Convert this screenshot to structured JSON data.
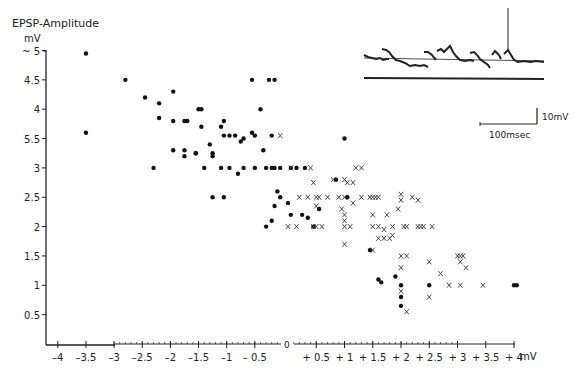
{
  "chart_data": {
    "type": "scatter",
    "title": "",
    "ylabel": "EPSP-Amplitude",
    "yunit": "mV",
    "xunit": "mV",
    "xlabel": "mV",
    "ylim": [
      0,
      5
    ],
    "xlim": [
      -4,
      4
    ],
    "grid": false,
    "y_ticks": [
      {
        "v": 5,
        "label": "~ 5"
      },
      {
        "v": 4.5,
        "label": "4.5"
      },
      {
        "v": 4,
        "label": "4"
      },
      {
        "v": 3.5,
        "label": "5.5"
      },
      {
        "v": 3,
        "label": "3"
      },
      {
        "v": 2.5,
        "label": "2.5"
      },
      {
        "v": 2,
        "label": "2"
      },
      {
        "v": 1.5,
        "label": "1.5"
      },
      {
        "v": 1,
        "label": "1"
      },
      {
        "v": 0.5,
        "label": "0.5"
      }
    ],
    "x_ticks_neg": [
      {
        "v": -4,
        "label": "-4"
      },
      {
        "v": -3.5,
        "label": "-3.5"
      },
      {
        "v": -3,
        "label": "-3"
      },
      {
        "v": -2.5,
        "label": "-2.5"
      },
      {
        "v": -2,
        "label": "-2"
      },
      {
        "v": -1.5,
        "label": "-1.5"
      },
      {
        "v": -1,
        "label": "-1"
      },
      {
        "v": -0.5,
        "label": "- 0.5"
      }
    ],
    "x_ticks_pos": [
      {
        "v": 0.5,
        "label": "+ 0.5"
      },
      {
        "v": 1,
        "label": "+ 1"
      },
      {
        "v": 1.5,
        "label": "+ 1.5"
      },
      {
        "v": 2,
        "label": "+ 2"
      },
      {
        "v": 2.5,
        "label": "+ 2.5"
      },
      {
        "v": 3,
        "label": "+ 3"
      },
      {
        "v": 3.5,
        "label": "+ 3.5"
      },
      {
        "v": 4,
        "label": "+ 4"
      }
    ],
    "zero_label": "0",
    "series": [
      {
        "name": "dots",
        "marker": "filled-circle",
        "points": [
          [
            -3.5,
            4.95
          ],
          [
            -3.5,
            3.6
          ],
          [
            -2.8,
            4.5
          ],
          [
            -2.45,
            4.2
          ],
          [
            -2.2,
            4.1
          ],
          [
            -1.95,
            4.3
          ],
          [
            -2.2,
            3.85
          ],
          [
            -1.95,
            3.8
          ],
          [
            -1.75,
            3.8
          ],
          [
            -1.7,
            3.8
          ],
          [
            -2.3,
            3.0
          ],
          [
            -1.95,
            3.3
          ],
          [
            -1.75,
            3.3
          ],
          [
            -1.75,
            3.2
          ],
          [
            -1.5,
            4.0
          ],
          [
            -1.45,
            4.0
          ],
          [
            -1.45,
            3.7
          ],
          [
            -1.3,
            3.4
          ],
          [
            -1.55,
            3.25
          ],
          [
            -1.55,
            3.25
          ],
          [
            -1.4,
            3.0
          ],
          [
            -1.25,
            3.25
          ],
          [
            -1.25,
            3.2
          ],
          [
            -1.1,
            3.7
          ],
          [
            -1.05,
            3.8
          ],
          [
            -1.05,
            3.55
          ],
          [
            -0.95,
            3.55
          ],
          [
            -0.85,
            3.55
          ],
          [
            -0.75,
            3.45
          ],
          [
            -0.7,
            3.5
          ],
          [
            -1.25,
            2.5
          ],
          [
            -1.05,
            2.5
          ],
          [
            -1.1,
            3.0
          ],
          [
            -0.95,
            3.0
          ],
          [
            -0.8,
            2.9
          ],
          [
            -0.7,
            3.0
          ],
          [
            -0.55,
            4.5
          ],
          [
            -0.4,
            4.0
          ],
          [
            -0.5,
            3.55
          ],
          [
            -0.55,
            3.6
          ],
          [
            -0.35,
            3.3
          ],
          [
            -0.3,
            3.0
          ],
          [
            -0.5,
            3.0
          ],
          [
            -0.2,
            3.0
          ],
          [
            -0.25,
            4.5
          ],
          [
            -0.15,
            4.5
          ],
          [
            -0.2,
            3.55
          ],
          [
            -0.15,
            3.0
          ],
          [
            -0.05,
            3.0
          ],
          [
            0.05,
            3.0
          ],
          [
            0.15,
            3.0
          ],
          [
            0.3,
            3.0
          ],
          [
            -0.3,
            2.0
          ],
          [
            -0.2,
            2.1
          ],
          [
            -0.1,
            2.6
          ],
          [
            -0.15,
            2.35
          ],
          [
            0.0,
            2.4
          ],
          [
            0.05,
            2.2
          ],
          [
            -0.05,
            2.5
          ],
          [
            0.45,
            2.0
          ],
          [
            0.55,
            2.3
          ],
          [
            0.85,
            2.8
          ],
          [
            1.0,
            3.5
          ],
          [
            1.05,
            2.5
          ],
          [
            1.45,
            1.6
          ],
          [
            1.6,
            1.1
          ],
          [
            1.65,
            1.05
          ],
          [
            1.9,
            1.15
          ],
          [
            2.0,
            1.0
          ],
          [
            2.0,
            0.8
          ],
          [
            2.0,
            0.65
          ],
          [
            2.5,
            1.0
          ],
          [
            4.0,
            1.0
          ],
          [
            4.05,
            1.0
          ],
          [
            0.25,
            2.2
          ],
          [
            0.35,
            2.15
          ]
        ]
      },
      {
        "name": "crosses",
        "marker": "x",
        "points": [
          [
            -0.05,
            3.55
          ],
          [
            0.05,
            3.0
          ],
          [
            0.2,
            2.5
          ],
          [
            0.35,
            2.5
          ],
          [
            0.5,
            2.5
          ],
          [
            0.5,
            2.35
          ],
          [
            0.55,
            2.5
          ],
          [
            0.4,
            3.0
          ],
          [
            0.45,
            2.75
          ],
          [
            0.7,
            2.5
          ],
          [
            0.9,
            2.5
          ],
          [
            0.8,
            2.8
          ],
          [
            1.0,
            2.8
          ],
          [
            1.05,
            2.75
          ],
          [
            1.15,
            2.75
          ],
          [
            1.0,
            2.5
          ],
          [
            1.0,
            2.2
          ],
          [
            1.0,
            2.1
          ],
          [
            1.15,
            2.4
          ],
          [
            1.2,
            3.0
          ],
          [
            1.3,
            3.0
          ],
          [
            1.3,
            2.5
          ],
          [
            1.45,
            2.5
          ],
          [
            1.5,
            2.5
          ],
          [
            1.55,
            2.5
          ],
          [
            1.6,
            2.5
          ],
          [
            1.5,
            2.2
          ],
          [
            1.75,
            2.2
          ],
          [
            1.95,
            2.3
          ],
          [
            2.0,
            2.55
          ],
          [
            2.0,
            2.45
          ],
          [
            2.2,
            2.5
          ],
          [
            2.3,
            2.45
          ],
          [
            0.0,
            2.0
          ],
          [
            0.15,
            2.0
          ],
          [
            0.45,
            2.0
          ],
          [
            0.5,
            2.0
          ],
          [
            0.6,
            2.0
          ],
          [
            1.0,
            2.0
          ],
          [
            1.1,
            2.0
          ],
          [
            1.5,
            2.0
          ],
          [
            1.6,
            2.0
          ],
          [
            1.85,
            2.0
          ],
          [
            2.05,
            2.0
          ],
          [
            2.1,
            2.0
          ],
          [
            2.3,
            2.0
          ],
          [
            2.35,
            2.0
          ],
          [
            2.4,
            2.0
          ],
          [
            2.55,
            2.0
          ],
          [
            1.7,
            1.95
          ],
          [
            1.6,
            1.8
          ],
          [
            1.7,
            1.8
          ],
          [
            1.8,
            1.8
          ],
          [
            1.85,
            1.85
          ],
          [
            1.0,
            1.7
          ],
          [
            1.5,
            1.6
          ],
          [
            2.0,
            1.5
          ],
          [
            2.1,
            1.5
          ],
          [
            2.0,
            1.3
          ],
          [
            2.5,
            1.4
          ],
          [
            2.7,
            1.2
          ],
          [
            2.85,
            1.0
          ],
          [
            3.0,
            1.5
          ],
          [
            3.05,
            1.5
          ],
          [
            3.1,
            1.5
          ],
          [
            3.05,
            1.4
          ],
          [
            3.15,
            1.3
          ],
          [
            3.05,
            1.0
          ],
          [
            3.45,
            1.0
          ],
          [
            2.0,
            0.9
          ],
          [
            2.5,
            0.8
          ],
          [
            2.1,
            0.55
          ],
          [
            0.95,
            2.3
          ]
        ]
      }
    ]
  },
  "inset": {
    "scale_voltage_label": "10mV",
    "scale_time_label": "100msec"
  }
}
